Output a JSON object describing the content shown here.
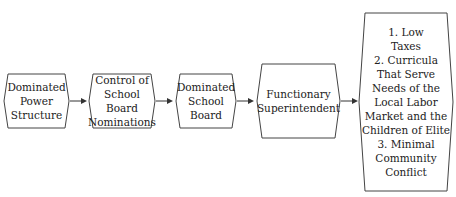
{
  "diagram": {
    "type": "flowchart",
    "direction": "left-to-right",
    "nodes": [
      {
        "id": "n1",
        "label": "Dominated\nPower\nStructure"
      },
      {
        "id": "n2",
        "label": "Control of\nSchool Board\nNominations"
      },
      {
        "id": "n3",
        "label": "Dominated\nSchool\nBoard"
      },
      {
        "id": "n4",
        "label": "Functionary\nSuperintendent"
      },
      {
        "id": "n5",
        "label": "1. Low\nTaxes\n2. Curricula\nThat Serve\nNeeds of the\nLocal Labor\nMarket and the\nChildren of Elite\n3. Minimal\nCommunity\nConflict"
      }
    ],
    "edges": [
      {
        "from": "n1",
        "to": "n2"
      },
      {
        "from": "n2",
        "to": "n3"
      },
      {
        "from": "n3",
        "to": "n4"
      },
      {
        "from": "n4",
        "to": "n5"
      }
    ]
  }
}
